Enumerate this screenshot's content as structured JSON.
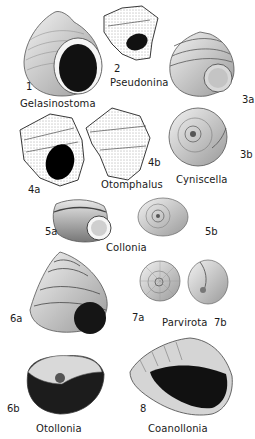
{
  "figure": {
    "specimens": [
      {
        "id": "1",
        "genus": "Gelasinostoma"
      },
      {
        "id": "2",
        "genus": "Pseudonina"
      },
      {
        "id": "3a",
        "genus": "Cyniscella"
      },
      {
        "id": "3b",
        "genus": "Cyniscella"
      },
      {
        "id": "4a",
        "genus": "Otomphalus"
      },
      {
        "id": "4b",
        "genus": "Otomphalus"
      },
      {
        "id": "5a",
        "genus": "Collonia"
      },
      {
        "id": "5b",
        "genus": "Collonia"
      },
      {
        "id": "6a",
        "genus": "Otollonia"
      },
      {
        "id": "6b",
        "genus": "Otollonia"
      },
      {
        "id": "7a",
        "genus": "Parvirota"
      },
      {
        "id": "7b",
        "genus": "Parvirota"
      },
      {
        "id": "8",
        "genus": "Coanollonia"
      }
    ]
  },
  "labels": {
    "gelasinostoma": "Gelasinostoma",
    "pseudonina": "Pseudonina",
    "otomphalus": "Otomphalus",
    "cyniscella": "Cyniscella",
    "collonia": "Collonia",
    "parvirota": "Parvirota",
    "otollonia": "Otollonia",
    "coanollonia": "Coanollonia"
  },
  "numbers": {
    "n1": "1",
    "n2": "2",
    "n3a": "3a",
    "n3b": "3b",
    "n4a": "4a",
    "n4b": "4b",
    "n5a": "5a",
    "n5b": "5b",
    "n6a": "6a",
    "n6b": "6b",
    "n7a": "7a",
    "n7b": "7b",
    "n8": "8"
  }
}
